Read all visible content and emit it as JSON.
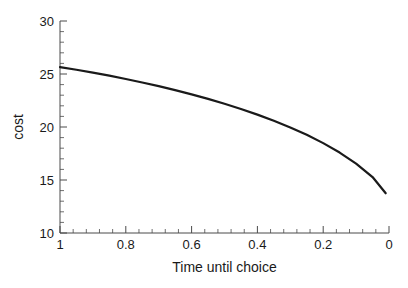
{
  "chart_data": {
    "type": "line",
    "title": "",
    "xlabel": "Time until choice",
    "ylabel": "cost",
    "xlim": [
      1,
      0
    ],
    "ylim": [
      10,
      30
    ],
    "x_reversed": true,
    "grid": false,
    "legend": "none",
    "x_ticks": [
      1,
      0.8,
      0.6,
      0.4,
      0.2,
      0
    ],
    "x_tick_labels": [
      "1",
      "0.8",
      "0.6",
      "0.4",
      "0.2",
      "0"
    ],
    "x_minor_ticks_per_interval": 4,
    "y_ticks": [
      30,
      25,
      20,
      15,
      10
    ],
    "y_tick_labels": [
      "30",
      "25",
      "20",
      "15",
      "10"
    ],
    "y_minor_ticks_per_interval": 4,
    "line_color": "#1a1a1a",
    "line_width": 2.2,
    "series": [
      {
        "name": "cost",
        "x": [
          1.0,
          0.95,
          0.9,
          0.85,
          0.8,
          0.75,
          0.7,
          0.65,
          0.6,
          0.55,
          0.5,
          0.45,
          0.4,
          0.35,
          0.3,
          0.25,
          0.2,
          0.15,
          0.1,
          0.05,
          0.01
        ],
        "values": [
          25.65,
          25.4,
          25.13,
          24.84,
          24.53,
          24.2,
          23.85,
          23.48,
          23.08,
          22.65,
          22.19,
          21.7,
          21.17,
          20.59,
          19.96,
          19.26,
          18.48,
          17.59,
          16.55,
          15.28,
          13.75
        ]
      }
    ]
  },
  "axes": {
    "y_title": "cost",
    "x_title": "Time until choice"
  }
}
